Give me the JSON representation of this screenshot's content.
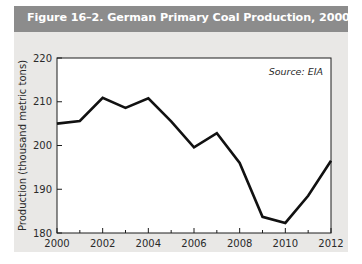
{
  "figure": {
    "title": "Figure 16–2. German Primary Coal Production, 2000–12",
    "title_bar_color": "#8c8c8c",
    "card_color": "#e9e8e6"
  },
  "chart_data": {
    "type": "line",
    "title": "",
    "xlabel": "",
    "ylabel": "Production (thousand metric tons)",
    "source_note": "Source: EIA",
    "xlim": [
      2000,
      2012
    ],
    "ylim": [
      180,
      220
    ],
    "grid": false,
    "legend": "none",
    "line_color": "#111111",
    "x_major_ticks": [
      2000,
      2002,
      2004,
      2006,
      2008,
      2010,
      2012
    ],
    "x_minor_ticks": [
      2001,
      2003,
      2005,
      2007,
      2009,
      2011
    ],
    "x_tick_labels": [
      "2000",
      "2002",
      "2004",
      "2006",
      "2008",
      "2010",
      "2012"
    ],
    "y_ticks": [
      180,
      190,
      200,
      210,
      220
    ],
    "y_tick_labels": [
      "180",
      "190",
      "200",
      "210",
      "220"
    ],
    "x": [
      2000,
      2001,
      2002,
      2003,
      2004,
      2005,
      2006,
      2007,
      2008,
      2009,
      2010,
      2011,
      2012
    ],
    "values": [
      205.0,
      205.6,
      210.9,
      208.6,
      210.8,
      205.5,
      199.6,
      202.8,
      196.0,
      183.7,
      182.3,
      188.5,
      196.5
    ],
    "series": [
      {
        "name": "German Primary Coal Production",
        "values": [
          205.0,
          205.6,
          210.9,
          208.6,
          210.8,
          205.5,
          199.6,
          202.8,
          196.0,
          183.7,
          182.3,
          188.5,
          196.5
        ]
      }
    ]
  }
}
